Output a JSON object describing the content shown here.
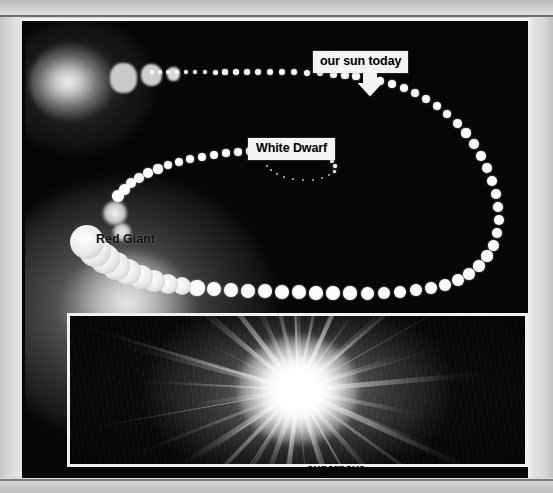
{
  "page": {
    "type": "scanned-book-figure",
    "background_color": "#cfcfcf"
  },
  "photo": {
    "background_color": "#050505",
    "frame_color": "#f2f2f2"
  },
  "labels": {
    "sun": {
      "text": "our sun today",
      "box_color": "#f4f4f2",
      "text_color": "#000000",
      "pointer": "down-arrow"
    },
    "white_dwarf": {
      "text": "White Dwarf",
      "box_color": "#f4f4f2",
      "text_color": "#000000"
    },
    "red_giant": {
      "text": "Red Giant",
      "text_color": "#111111"
    },
    "supernova": {
      "text": "supernova",
      "text_color": "#0a0a0a"
    }
  },
  "chart_data": {
    "type": "scatter",
    "xlabel": "",
    "ylabel": "",
    "grid": false,
    "legend": "none",
    "annotations": [
      {
        "text": "our sun today",
        "x": 355,
        "y": 75,
        "style": "white-box-with-down-arrow"
      },
      {
        "text": "White Dwarf",
        "x": 268,
        "y": 124,
        "style": "white-box"
      },
      {
        "text": "Red Giant",
        "x": 101,
        "y": 217,
        "style": "plain-black-text"
      },
      {
        "text": "supernova",
        "x": 318,
        "y": 447,
        "style": "plain-black-text"
      }
    ],
    "series": [
      {
        "name": "main-sequence-track",
        "note": "dotted path, dot radius grows with stellar size along the track",
        "points": [
          {
            "x": 152,
            "y": 72,
            "r": 1.6
          },
          {
            "x": 160,
            "y": 72,
            "r": 1.8
          },
          {
            "x": 168,
            "y": 72,
            "r": 2.0
          },
          {
            "x": 177,
            "y": 72,
            "r": 2.1
          },
          {
            "x": 186,
            "y": 72,
            "r": 2.2
          },
          {
            "x": 195,
            "y": 72,
            "r": 2.3
          },
          {
            "x": 205,
            "y": 72,
            "r": 2.4
          },
          {
            "x": 215,
            "y": 72,
            "r": 2.5
          },
          {
            "x": 225,
            "y": 72,
            "r": 2.6
          },
          {
            "x": 236,
            "y": 72,
            "r": 2.7
          },
          {
            "x": 247,
            "y": 72,
            "r": 2.8
          },
          {
            "x": 258,
            "y": 72,
            "r": 2.9
          },
          {
            "x": 270,
            "y": 72,
            "r": 3.0
          },
          {
            "x": 282,
            "y": 72,
            "r": 3.1
          },
          {
            "x": 294,
            "y": 72,
            "r": 3.2
          },
          {
            "x": 307,
            "y": 73,
            "r": 3.3
          },
          {
            "x": 320,
            "y": 73,
            "r": 3.4
          },
          {
            "x": 333,
            "y": 74,
            "r": 3.5
          },
          {
            "x": 345,
            "y": 75,
            "r": 3.6
          },
          {
            "x": 356,
            "y": 76,
            "r": 3.6
          },
          {
            "x": 368,
            "y": 78,
            "r": 3.7
          },
          {
            "x": 380,
            "y": 81,
            "r": 3.8
          },
          {
            "x": 392,
            "y": 84,
            "r": 3.9
          },
          {
            "x": 404,
            "y": 88,
            "r": 4.0
          },
          {
            "x": 415,
            "y": 93,
            "r": 4.1
          },
          {
            "x": 426,
            "y": 99,
            "r": 4.2
          },
          {
            "x": 437,
            "y": 106,
            "r": 4.3
          },
          {
            "x": 447,
            "y": 114,
            "r": 4.4
          },
          {
            "x": 457,
            "y": 123,
            "r": 4.5
          },
          {
            "x": 466,
            "y": 133,
            "r": 4.6
          },
          {
            "x": 474,
            "y": 144,
            "r": 4.7
          },
          {
            "x": 481,
            "y": 156,
            "r": 4.8
          },
          {
            "x": 487,
            "y": 168,
            "r": 4.9
          },
          {
            "x": 492,
            "y": 181,
            "r": 5.0
          },
          {
            "x": 496,
            "y": 194,
            "r": 5.1
          },
          {
            "x": 498,
            "y": 207,
            "r": 5.2
          },
          {
            "x": 499,
            "y": 220,
            "r": 5.3
          },
          {
            "x": 497,
            "y": 233,
            "r": 5.4
          },
          {
            "x": 493,
            "y": 245,
            "r": 5.5
          },
          {
            "x": 487,
            "y": 256,
            "r": 5.6
          },
          {
            "x": 479,
            "y": 266,
            "r": 5.7
          },
          {
            "x": 469,
            "y": 274,
            "r": 5.8
          },
          {
            "x": 458,
            "y": 280,
            "r": 5.9
          },
          {
            "x": 445,
            "y": 285,
            "r": 6.0
          },
          {
            "x": 431,
            "y": 288,
            "r": 6.1
          },
          {
            "x": 416,
            "y": 290,
            "r": 6.2
          },
          {
            "x": 400,
            "y": 292,
            "r": 6.3
          },
          {
            "x": 384,
            "y": 293,
            "r": 6.4
          },
          {
            "x": 367,
            "y": 293,
            "r": 6.5
          },
          {
            "x": 350,
            "y": 293,
            "r": 6.6
          },
          {
            "x": 333,
            "y": 293,
            "r": 6.7
          },
          {
            "x": 316,
            "y": 293,
            "r": 6.8
          },
          {
            "x": 299,
            "y": 292,
            "r": 6.9
          },
          {
            "x": 282,
            "y": 292,
            "r": 7.0
          },
          {
            "x": 265,
            "y": 291,
            "r": 7.1
          },
          {
            "x": 248,
            "y": 291,
            "r": 7.2
          },
          {
            "x": 231,
            "y": 290,
            "r": 7.3
          },
          {
            "x": 214,
            "y": 289,
            "r": 7.4
          },
          {
            "x": 197,
            "y": 288,
            "r": 7.6
          }
        ]
      },
      {
        "name": "red-giant-expansion",
        "note": "large overlapping blobs: the star swells into a red giant",
        "points": [
          {
            "x": 182,
            "y": 286,
            "r": 9.0
          },
          {
            "x": 168,
            "y": 284,
            "r": 10.0
          },
          {
            "x": 154,
            "y": 281,
            "r": 11.0
          },
          {
            "x": 141,
            "y": 277,
            "r": 12.0
          },
          {
            "x": 128,
            "y": 272,
            "r": 13.0
          },
          {
            "x": 116,
            "y": 266,
            "r": 14.0
          },
          {
            "x": 105,
            "y": 259,
            "r": 15.0
          },
          {
            "x": 95,
            "y": 251,
            "r": 16.0
          },
          {
            "x": 87,
            "y": 242,
            "r": 17.0
          }
        ]
      },
      {
        "name": "white-dwarf-collapse",
        "note": "returning upper arc, dots shrink toward a tiny white dwarf",
        "points": [
          {
            "x": 118,
            "y": 196,
            "r": 5.8
          },
          {
            "x": 124,
            "y": 189,
            "r": 5.5
          },
          {
            "x": 131,
            "y": 183,
            "r": 5.2
          },
          {
            "x": 139,
            "y": 178,
            "r": 5.0
          },
          {
            "x": 148,
            "y": 173,
            "r": 4.8
          },
          {
            "x": 158,
            "y": 169,
            "r": 4.6
          },
          {
            "x": 168,
            "y": 165,
            "r": 4.4
          },
          {
            "x": 179,
            "y": 162,
            "r": 4.2
          },
          {
            "x": 190,
            "y": 159,
            "r": 4.1
          },
          {
            "x": 202,
            "y": 157,
            "r": 4.0
          },
          {
            "x": 214,
            "y": 155,
            "r": 3.9
          },
          {
            "x": 226,
            "y": 153,
            "r": 3.8
          },
          {
            "x": 238,
            "y": 152,
            "r": 3.7
          },
          {
            "x": 250,
            "y": 151,
            "r": 3.6
          },
          {
            "x": 262,
            "y": 150,
            "r": 3.5
          },
          {
            "x": 274,
            "y": 150,
            "r": 3.4
          },
          {
            "x": 286,
            "y": 150,
            "r": 3.2
          },
          {
            "x": 297,
            "y": 151,
            "r": 3.0
          },
          {
            "x": 308,
            "y": 152,
            "r": 2.8
          },
          {
            "x": 318,
            "y": 154,
            "r": 2.5
          },
          {
            "x": 326,
            "y": 157,
            "r": 2.2
          },
          {
            "x": 332,
            "y": 161,
            "r": 1.9
          },
          {
            "x": 335,
            "y": 166,
            "r": 1.7
          },
          {
            "x": 334,
            "y": 171,
            "r": 1.5
          },
          {
            "x": 329,
            "y": 175,
            "r": 1.3
          },
          {
            "x": 322,
            "y": 178,
            "r": 1.2
          },
          {
            "x": 313,
            "y": 180,
            "r": 1.1
          },
          {
            "x": 303,
            "y": 180,
            "r": 1.0
          },
          {
            "x": 293,
            "y": 179,
            "r": 0.9
          },
          {
            "x": 284,
            "y": 177,
            "r": 0.8
          },
          {
            "x": 277,
            "y": 174,
            "r": 0.8
          },
          {
            "x": 271,
            "y": 170,
            "r": 0.7
          },
          {
            "x": 267,
            "y": 166,
            "r": 0.7
          }
        ]
      }
    ],
    "glow_objects": [
      {
        "name": "stellar-nebula",
        "x": 47,
        "y": 61,
        "w": 86,
        "h": 78
      },
      {
        "name": "protostar-clump-1",
        "x": 98,
        "y": 57,
        "w": 27,
        "h": 30
      },
      {
        "name": "protostar-clump-2",
        "x": 126,
        "y": 54,
        "w": 21,
        "h": 22
      },
      {
        "name": "protostar-clump-3",
        "x": 148,
        "y": 53,
        "w": 13,
        "h": 14
      },
      {
        "name": "red-giant-glow",
        "x": 80,
        "y": 300,
        "w": 290,
        "h": 260
      }
    ]
  },
  "supernova_inset": {
    "caption": "supernova",
    "border_color": "#f0f0f0",
    "background_color": "#0a0a0a",
    "ray_count": 44
  }
}
